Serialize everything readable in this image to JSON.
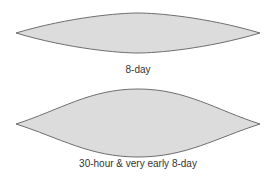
{
  "colors": {
    "fill": "#dcdcdc",
    "stroke": "#6e6e6e",
    "label": "#333333"
  },
  "shapes": [
    {
      "name": "8-day",
      "label": "8-day",
      "outline": "lenticular (shallow curvature, pointed ends)"
    },
    {
      "name": "30-hour-and-very-early-8-day",
      "label": "30-hour & very early 8-day",
      "outline": "lenticular (deeper S-curved sides, pointed ends)"
    }
  ]
}
